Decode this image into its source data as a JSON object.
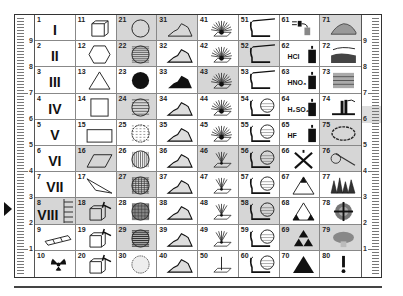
{
  "rulers": {
    "left": {
      "labels": [
        "9",
        "8",
        "7",
        "6",
        "5",
        "4",
        "3",
        "2",
        "1"
      ]
    },
    "right": {
      "labels": [
        "9",
        "8",
        "7",
        "6",
        "5",
        "4",
        "3",
        "2",
        "1"
      ]
    }
  },
  "colors": {
    "shade": "#d6d6d6",
    "ink": "#111111",
    "border": "#333333"
  },
  "cells": [
    {
      "n": "1",
      "label": "I",
      "icon": "roman-numeral",
      "shaded": false
    },
    {
      "n": "2",
      "label": "II",
      "icon": "roman-numeral",
      "shaded": false
    },
    {
      "n": "3",
      "label": "III",
      "icon": "roman-numeral",
      "shaded": false
    },
    {
      "n": "4",
      "label": "IV",
      "icon": "roman-numeral",
      "shaded": false
    },
    {
      "n": "5",
      "label": "V",
      "icon": "roman-numeral",
      "shaded": false
    },
    {
      "n": "6",
      "label": "VI",
      "icon": "roman-numeral",
      "shaded": false
    },
    {
      "n": "7",
      "label": "VII",
      "icon": "roman-numeral",
      "shaded": false
    },
    {
      "n": "8",
      "label": "VIII",
      "icon": "roman-numeral-ladder",
      "shaded": true
    },
    {
      "n": "9",
      "label": "",
      "icon": "bar-tube-icon",
      "shaded": false
    },
    {
      "n": "10",
      "label": "",
      "icon": "radiation-icon",
      "shaded": false
    },
    {
      "n": "11",
      "label": "",
      "icon": "cube-icon",
      "shaded": false
    },
    {
      "n": "12",
      "label": "",
      "icon": "hexagon-icon",
      "shaded": false
    },
    {
      "n": "13",
      "label": "",
      "icon": "triangle-icon",
      "shaded": false
    },
    {
      "n": "14",
      "label": "",
      "icon": "square-icon",
      "shaded": false
    },
    {
      "n": "15",
      "label": "",
      "icon": "rectangle-icon",
      "shaded": false
    },
    {
      "n": "16",
      "label": "",
      "icon": "parallelogram-icon",
      "shaded": true
    },
    {
      "n": "17",
      "label": "",
      "icon": "thin-triangle-icon",
      "shaded": false
    },
    {
      "n": "18",
      "label": "",
      "icon": "split-box-hammer-icon",
      "shaded": true
    },
    {
      "n": "19",
      "label": "",
      "icon": "box-hammer-icon",
      "shaded": false
    },
    {
      "n": "20",
      "label": "",
      "icon": "broken-box-hammer-icon",
      "shaded": false
    },
    {
      "n": "21",
      "label": "",
      "icon": "circle-empty-icon",
      "shaded": true
    },
    {
      "n": "22",
      "label": "",
      "icon": "circle-horizontal-lines-icon",
      "shaded": true
    },
    {
      "n": "23",
      "label": "",
      "icon": "circle-filled-icon",
      "shaded": false
    },
    {
      "n": "24",
      "label": "",
      "icon": "circle-sparse-lines-icon",
      "shaded": true
    },
    {
      "n": "25",
      "label": "",
      "icon": "circle-dashed-lines-icon",
      "shaded": false
    },
    {
      "n": "26",
      "label": "",
      "icon": "circle-vertical-lines-icon",
      "shaded": false
    },
    {
      "n": "27",
      "label": "",
      "icon": "circle-cross-half-icon",
      "shaded": true
    },
    {
      "n": "28",
      "label": "",
      "icon": "circle-grid-icon",
      "shaded": false
    },
    {
      "n": "29",
      "label": "",
      "icon": "circle-thick-lines-icon",
      "shaded": true
    },
    {
      "n": "30",
      "label": "",
      "icon": "circle-texture-icon",
      "shaded": false
    },
    {
      "n": "31",
      "label": "",
      "icon": "mountain-outline-icon",
      "shaded": true
    },
    {
      "n": "32",
      "label": "",
      "icon": "mountain-dashed-icon",
      "shaded": false
    },
    {
      "n": "33",
      "label": "",
      "icon": "mountain-filled-icon",
      "shaded": false
    },
    {
      "n": "34",
      "label": "",
      "icon": "mountain-lines-icon",
      "shaded": false
    },
    {
      "n": "35",
      "label": "",
      "icon": "mountain-dots-icon",
      "shaded": false
    },
    {
      "n": "36",
      "label": "",
      "icon": "mountain-vertical-icon",
      "shaded": false
    },
    {
      "n": "37",
      "label": "",
      "icon": "mountain-cross-icon",
      "shaded": false
    },
    {
      "n": "38",
      "label": "",
      "icon": "mountain-grid-icon",
      "shaded": false
    },
    {
      "n": "39",
      "label": "",
      "icon": "mountain-horizontal-icon",
      "shaded": false
    },
    {
      "n": "40",
      "label": "",
      "icon": "mountain-texture-icon",
      "shaded": false
    },
    {
      "n": "41",
      "label": "",
      "icon": "rays-plane-icon",
      "shaded": false
    },
    {
      "n": "42",
      "label": "",
      "icon": "rays-plane-icon",
      "shaded": false
    },
    {
      "n": "43",
      "label": "",
      "icon": "rays-plane-icon",
      "shaded": true
    },
    {
      "n": "44",
      "label": "",
      "icon": "rays-plane-icon",
      "shaded": false
    },
    {
      "n": "45",
      "label": "",
      "icon": "rays-plane-icon",
      "shaded": false
    },
    {
      "n": "46",
      "label": "",
      "icon": "rays-narrow-icon",
      "shaded": true
    },
    {
      "n": "47",
      "label": "",
      "icon": "rays-narrow-icon",
      "shaded": false
    },
    {
      "n": "48",
      "label": "",
      "icon": "rays-narrow-icon",
      "shaded": false
    },
    {
      "n": "49",
      "label": "",
      "icon": "rays-narrow-icon",
      "shaded": false
    },
    {
      "n": "50",
      "label": "",
      "icon": "single-ray-plane-icon",
      "shaded": false
    },
    {
      "n": "51",
      "label": "",
      "icon": "blowpipe-icon",
      "shaded": false
    },
    {
      "n": "52",
      "label": "",
      "icon": "blowpipe-icon",
      "shaded": true
    },
    {
      "n": "53",
      "label": "",
      "icon": "blowpipe-icon",
      "shaded": false
    },
    {
      "n": "54",
      "label": "",
      "icon": "blowpipe-sphere-icon",
      "shaded": false
    },
    {
      "n": "55",
      "label": "",
      "icon": "blowpipe-sphere-icon",
      "shaded": false
    },
    {
      "n": "56",
      "label": "",
      "icon": "blowpipe-sphere-icon",
      "shaded": true
    },
    {
      "n": "57",
      "label": "",
      "icon": "blowpipe-sphere-icon",
      "shaded": false
    },
    {
      "n": "58",
      "label": "",
      "icon": "blowpipe-sphere-icon",
      "shaded": true
    },
    {
      "n": "59",
      "label": "",
      "icon": "blowpipe-sphere-icon",
      "shaded": false
    },
    {
      "n": "60",
      "label": "",
      "icon": "blowpipe-sphere-icon",
      "shaded": false
    },
    {
      "n": "61",
      "label": "",
      "icon": "dropper-icon",
      "shaded": false
    },
    {
      "n": "62",
      "label": "HCl",
      "icon": "acid-bottle-icon",
      "shaded": false
    },
    {
      "n": "63",
      "label": "HNO₃",
      "icon": "acid-bottle-icon",
      "shaded": false
    },
    {
      "n": "64",
      "label": "H₂SO₄",
      "icon": "acid-bottle-icon",
      "shaded": false
    },
    {
      "n": "65",
      "label": "HF",
      "icon": "acid-bottle-icon",
      "shaded": false
    },
    {
      "n": "66",
      "label": "",
      "icon": "crossed-bottle-icon",
      "shaded": false
    },
    {
      "n": "67",
      "label": "",
      "icon": "triangle-top-filled-icon",
      "shaded": false
    },
    {
      "n": "68",
      "label": "",
      "icon": "triangle-corners-filled-icon",
      "shaded": false
    },
    {
      "n": "69",
      "label": "",
      "icon": "triforce-icon",
      "shaded": true
    },
    {
      "n": "70",
      "label": "",
      "icon": "triangle-filled-icon",
      "shaded": false
    },
    {
      "n": "71",
      "label": "",
      "icon": "mound-dots-icon",
      "shaded": true
    },
    {
      "n": "72",
      "label": "",
      "icon": "layered-rock-icon",
      "shaded": false
    },
    {
      "n": "73",
      "label": "",
      "icon": "fibrous-block-icon",
      "shaded": false
    },
    {
      "n": "74",
      "label": "",
      "icon": "crystal-columns-icon",
      "shaded": false
    },
    {
      "n": "75",
      "label": "",
      "icon": "chain-loop-icon",
      "shaded": true
    },
    {
      "n": "76",
      "label": "",
      "icon": "curl-icon",
      "shaded": true
    },
    {
      "n": "77",
      "label": "",
      "icon": "crystal-cluster-icon",
      "shaded": false
    },
    {
      "n": "78",
      "label": "",
      "icon": "target-cross-icon",
      "shaded": false
    },
    {
      "n": "79",
      "label": "",
      "icon": "fossil-icon",
      "shaded": true
    },
    {
      "n": "80",
      "label": "!",
      "icon": "exclamation-icon",
      "shaded": false
    }
  ]
}
